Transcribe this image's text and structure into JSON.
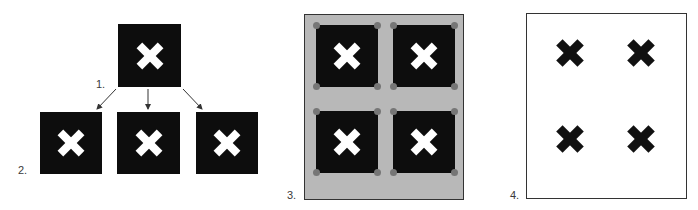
{
  "figure": {
    "colors": {
      "tile": "#0d0d0d",
      "mark_on_tile": "#ffffff",
      "sheet": "#b8b8b8",
      "corner_dot": "#767676",
      "border": "#333333",
      "printed_mark": "#111111"
    },
    "steps": [
      {
        "id": "step1",
        "label": "1.",
        "content": "original tile with white X"
      },
      {
        "id": "step2",
        "label": "2.",
        "content": "three duplicated tiles"
      },
      {
        "id": "step3",
        "label": "3.",
        "content": "four tiles arranged on gray sheet with corner dots"
      },
      {
        "id": "step4",
        "label": "4.",
        "content": "white sheet with four black X marks"
      }
    ],
    "icons": {
      "x_mark": "x-mark-icon",
      "arrow": "arrow-down-icon"
    }
  }
}
